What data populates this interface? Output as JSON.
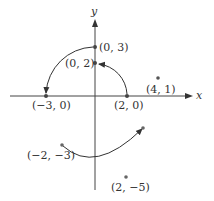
{
  "diagram": {
    "type": "coordinate-plane-rotations",
    "axes": {
      "x_label": "x",
      "y_label": "y"
    },
    "points": [
      {
        "id": "p_0_3",
        "label": "(0, 3)",
        "x": 0,
        "y": 3
      },
      {
        "id": "p_0_2",
        "label": "(0, 2)",
        "x": 0,
        "y": 2
      },
      {
        "id": "p_m3_0",
        "label": "(−3, 0)",
        "x": -3,
        "y": 0
      },
      {
        "id": "p_2_0",
        "label": "(2, 0)",
        "x": 2,
        "y": 0
      },
      {
        "id": "p_4_1",
        "label": "(4, 1)",
        "x": 4,
        "y": 1
      },
      {
        "id": "p_m2_m3",
        "label": "(−2, −3)",
        "x": -2,
        "y": -3
      },
      {
        "id": "p_3_m2",
        "label": "",
        "x": 3,
        "y": -2
      },
      {
        "id": "p_2_m5",
        "label": "(2, −5)",
        "x": 2,
        "y": -5
      }
    ],
    "arcs": [
      {
        "from": "(2, 0)",
        "to": "(0, 2)",
        "direction": "counterclockwise"
      },
      {
        "from": "(0, 3)",
        "to": "(−3, 0)",
        "direction": "counterclockwise"
      },
      {
        "from": "(−2, −3)",
        "to": "(3, −2)",
        "direction": "counterclockwise"
      }
    ]
  },
  "labels": {
    "x_axis": "x",
    "y_axis": "y",
    "p_0_3": "(0, 3)",
    "p_0_2": "(0, 2)",
    "p_m3_0": "(−3, 0)",
    "p_2_0": "(2, 0)",
    "p_4_1": "(4, 1)",
    "p_m2_m3": "(−2, −3)",
    "p_2_m5": "(2, −5)"
  }
}
